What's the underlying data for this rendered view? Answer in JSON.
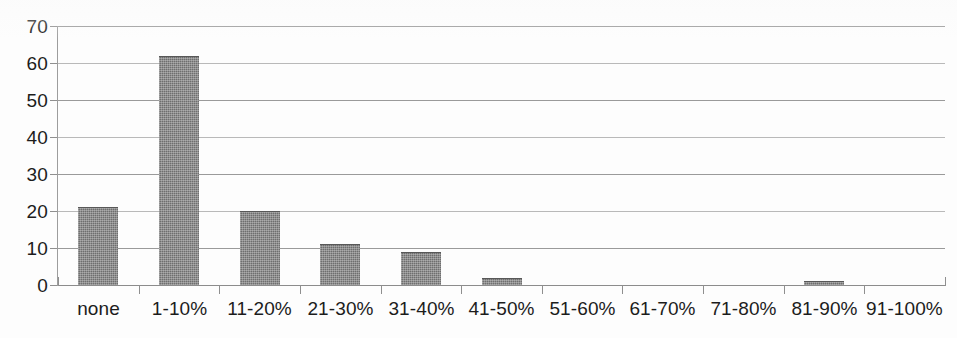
{
  "chart_data": {
    "type": "bar",
    "title": "",
    "subtitle": "",
    "xlabel": "",
    "ylabel": "",
    "categories": [
      "none",
      "1-10%",
      "11-20%",
      "21-30%",
      "31-40%",
      "41-50%",
      "51-60%",
      "61-70%",
      "71-80%",
      "81-90%",
      "91-100%"
    ],
    "values": [
      21,
      62,
      20,
      11,
      9,
      2,
      0,
      0,
      0,
      1,
      0
    ],
    "ylim": [
      0,
      70
    ],
    "ytick_labels": [
      "0",
      "10",
      "20",
      "30",
      "40",
      "50",
      "60",
      "70"
    ],
    "ytick_values": [
      0,
      10,
      20,
      30,
      40,
      50,
      60,
      70
    ],
    "ytick_step": 10,
    "grid": true,
    "grid_axis": "y",
    "legend": false,
    "legend_position": "none",
    "bar_color": "#6e6e6e",
    "gridline_color": "#9a9a9a",
    "axis_color": "#8f8f8f",
    "text_color": "#1c1c1c",
    "background_color": "#ffffff"
  }
}
